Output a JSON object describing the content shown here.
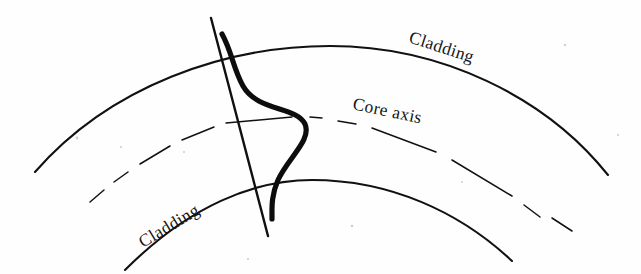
{
  "figure": {
    "kind": "line-drawing",
    "caption_present": false,
    "background_color": "#fefefe",
    "ink_color": "#111111",
    "width": 641,
    "height": 274
  },
  "labels": {
    "cladding_top": "Cladding",
    "core_axis": "Core axis",
    "cladding_bottom": "Cladding"
  },
  "label_placement": {
    "cladding_top": {
      "x": 408,
      "y": 42,
      "rotation": 18,
      "anchor": "start"
    },
    "core_axis": {
      "x": 352,
      "y": 109,
      "rotation": 12,
      "anchor": "start"
    },
    "cladding_bottom": {
      "x": 143,
      "y": 248,
      "rotation": -31,
      "anchor": "start"
    }
  },
  "geometry": {
    "outer_cladding_arc": {
      "name": "outer-cladding-boundary",
      "path": "M 35,172 C 110,86 225,46 330,46 C 440,46 545,96 608,175",
      "style": "solid",
      "stroke_width": 2.1
    },
    "inner_cladding_arc": {
      "name": "inner-cladding-boundary",
      "path": "M 125,270 C 190,205 255,180 312,180 C 390,180 460,212 512,261",
      "style": "solid",
      "stroke_width": 2.1
    },
    "core_axis_arc": {
      "name": "core-axis-centerline",
      "path": "M 90,202 C 150,150 235,119 322,119 C 420,119 510,164 572,231",
      "style": "dash-dot",
      "stroke_width": 1.5,
      "dash_segments": [
        {
          "d": "M 90,202 L 104,190"
        },
        {
          "d": "M 114,182 L 128,172"
        },
        {
          "d": "M 140,164 L 170,146"
        },
        {
          "d": "M 182,140 L 214,127"
        },
        {
          "d": "M 226,123 L 292,117"
        },
        {
          "d": "M 310,117 L 322,118"
        },
        {
          "d": "M 338,121 L 356,124"
        },
        {
          "d": "M 372,128 L 436,152"
        },
        {
          "d": "M 452,160 L 512,196"
        },
        {
          "d": "M 524,205 L 540,217"
        },
        {
          "d": "M 552,218 L 572,231"
        }
      ]
    },
    "transverse_axis_line": {
      "name": "transverse-reference-line",
      "x1": 211,
      "y1": 18,
      "x2": 268,
      "y2": 236,
      "style": "solid",
      "stroke_width": 2.4
    },
    "mode_field_curve": {
      "name": "mode-field-distribution",
      "path": "M 222,34 C 232,52 233,68 243,86 C 258,112 296,106 305,124 C 312,140 288,158 278,180 C 271,196 272,208 272,219",
      "style": "solid-heavy",
      "stroke_width": 5.2,
      "description": "Thick S-shaped mode intensity profile peaking toward the outer side of the bend"
    }
  },
  "specks": [
    {
      "x": 77,
      "y": 138,
      "r": 1.4
    },
    {
      "x": 121,
      "y": 147,
      "r": 1.1
    },
    {
      "x": 184,
      "y": 152,
      "r": 1.0
    },
    {
      "x": 352,
      "y": 226,
      "r": 1.3
    },
    {
      "x": 565,
      "y": 45,
      "r": 1.2
    },
    {
      "x": 618,
      "y": 135,
      "r": 1.1
    },
    {
      "x": 462,
      "y": 182,
      "r": 1.0
    },
    {
      "x": 248,
      "y": 259,
      "r": 1.1
    }
  ]
}
